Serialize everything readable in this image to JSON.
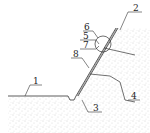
{
  "figure": {
    "type": "engineering cross-section of slope with reinforcement",
    "labels": [
      {
        "id": "1",
        "text": "1",
        "x": 36,
        "y": 84
      },
      {
        "id": "2",
        "text": "2",
        "x": 135,
        "y": 11
      },
      {
        "id": "3",
        "text": "3",
        "x": 95,
        "y": 112
      },
      {
        "id": "4",
        "text": "4",
        "x": 133,
        "y": 99
      },
      {
        "id": "5",
        "text": "5",
        "x": 83,
        "y": 38
      },
      {
        "id": "6",
        "text": "6",
        "x": 86,
        "y": 30
      },
      {
        "id": "7",
        "text": "7",
        "x": 83,
        "y": 48
      },
      {
        "id": "8",
        "text": "8",
        "x": 74,
        "y": 57
      }
    ],
    "colors": {
      "line": "#333333",
      "soil_dot": "#9a9a9a",
      "background": "#ffffff"
    }
  }
}
